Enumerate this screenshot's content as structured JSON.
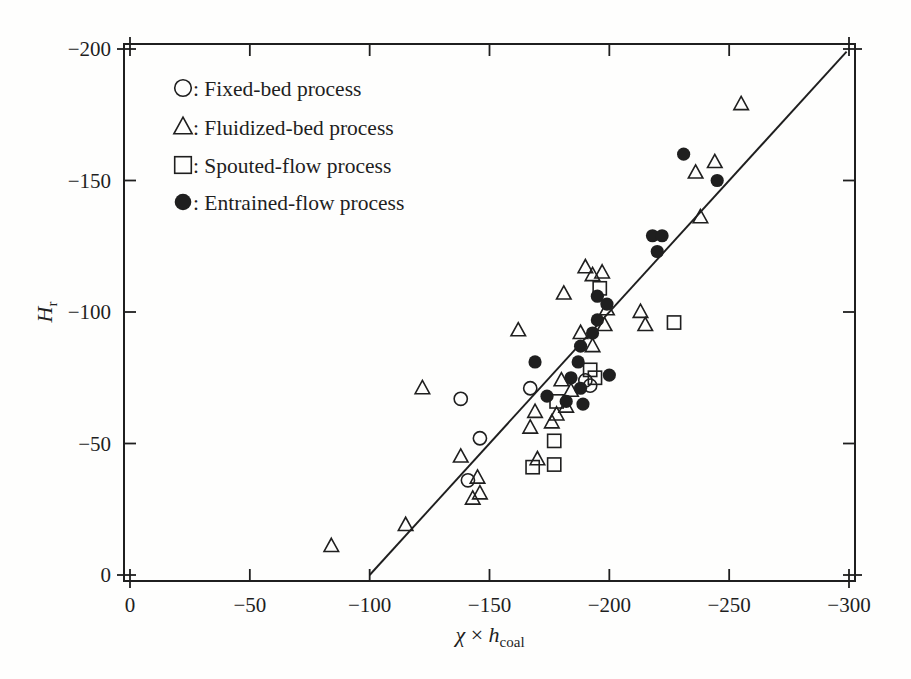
{
  "figure": {
    "background": "#fefefd",
    "ink": "#1f1f1f"
  },
  "chart_data": {
    "type": "scatter",
    "title": "",
    "xlabel": {
      "chi": "χ",
      "times": "×",
      "var": "h",
      "sub": "coal"
    },
    "ylabel": {
      "var": "H",
      "sub": "r"
    },
    "xlim": [
      0,
      -300
    ],
    "ylim": [
      0,
      -200
    ],
    "x_ticks": [
      {
        "v": 0,
        "label": "0"
      },
      {
        "v": -50,
        "label": "−50"
      },
      {
        "v": -100,
        "label": "−100"
      },
      {
        "v": -150,
        "label": "−150"
      },
      {
        "v": -200,
        "label": "−200"
      },
      {
        "v": -250,
        "label": "−250"
      },
      {
        "v": -300,
        "label": "−300"
      }
    ],
    "y_ticks": [
      {
        "v": 0,
        "label": "0"
      },
      {
        "v": -50,
        "label": "−50"
      },
      {
        "v": -100,
        "label": "−100"
      },
      {
        "v": -150,
        "label": "−150"
      },
      {
        "v": -200,
        "label": "−200"
      }
    ],
    "grid": false,
    "legend": {
      "position": "top-left-inside",
      "separator": ":",
      "items": [
        {
          "marker": "open-circle",
          "label": "Fixed-bed process"
        },
        {
          "marker": "open-triangle",
          "label": "Fluidized-bed process"
        },
        {
          "marker": "open-square",
          "label": "Spouted-flow process"
        },
        {
          "marker": "filled-circle",
          "label": "Entrained-flow process"
        }
      ]
    },
    "fit_line": {
      "from": [
        -100,
        0
      ],
      "to": [
        -299,
        -199
      ]
    },
    "series": [
      {
        "name": "Fixed-bed process",
        "marker": "open-circle",
        "points": [
          [
            -138,
            -67
          ],
          [
            -146,
            -52
          ],
          [
            -141,
            -36
          ],
          [
            -167,
            -71
          ],
          [
            -190,
            -74
          ],
          [
            -192,
            -72
          ]
        ]
      },
      {
        "name": "Fluidized-bed process",
        "marker": "open-triangle",
        "points": [
          [
            -84,
            -11
          ],
          [
            -115,
            -19
          ],
          [
            -122,
            -71
          ],
          [
            -138,
            -45
          ],
          [
            -143,
            -29
          ],
          [
            -145,
            -37
          ],
          [
            -146,
            -31
          ],
          [
            -162,
            -93
          ],
          [
            -167,
            -56
          ],
          [
            -169,
            -62
          ],
          [
            -170,
            -44
          ],
          [
            -176,
            -58
          ],
          [
            -178,
            -61
          ],
          [
            -180,
            -74
          ],
          [
            -181,
            -107
          ],
          [
            -182,
            -64
          ],
          [
            -184,
            -70
          ],
          [
            -188,
            -92
          ],
          [
            -190,
            -117
          ],
          [
            -193,
            -114
          ],
          [
            -193,
            -87
          ],
          [
            -197,
            -115
          ],
          [
            -198,
            -95
          ],
          [
            -199,
            -101
          ],
          [
            -213,
            -100
          ],
          [
            -215,
            -95
          ],
          [
            -236,
            -153
          ],
          [
            -238,
            -136
          ],
          [
            -244,
            -157
          ],
          [
            -255,
            -179
          ]
        ]
      },
      {
        "name": "Spouted-flow process",
        "marker": "open-square",
        "points": [
          [
            -196,
            -109
          ],
          [
            -227,
            -96
          ],
          [
            -192,
            -78
          ],
          [
            -194,
            -75
          ],
          [
            -178,
            -66
          ],
          [
            -177,
            -51
          ],
          [
            -168,
            -41
          ],
          [
            -177,
            -42
          ]
        ]
      },
      {
        "name": "Entrained-flow process",
        "marker": "filled-circle",
        "points": [
          [
            -169,
            -81
          ],
          [
            -174,
            -68
          ],
          [
            -182,
            -66
          ],
          [
            -184,
            -75
          ],
          [
            -187,
            -81
          ],
          [
            -188,
            -71
          ],
          [
            -188,
            -87
          ],
          [
            -189,
            -65
          ],
          [
            -193,
            -92
          ],
          [
            -195,
            -97
          ],
          [
            -195,
            -106
          ],
          [
            -199,
            -103
          ],
          [
            -200,
            -76
          ],
          [
            -218,
            -129
          ],
          [
            -220,
            -123
          ],
          [
            -222,
            -129
          ],
          [
            -231,
            -160
          ],
          [
            -245,
            -150
          ]
        ]
      }
    ]
  }
}
